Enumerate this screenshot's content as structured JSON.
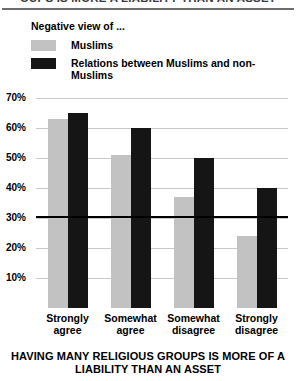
{
  "header": {
    "clipped_headline": "OUPS IS MORE A LIABILITY THAN AN ASSET"
  },
  "legend": {
    "title": "Negative view of ...",
    "items": [
      {
        "label": "Muslims",
        "color": "#c2c2c2"
      },
      {
        "label": "Relations between Muslims and non-Muslims",
        "color": "#151515"
      }
    ]
  },
  "chart_data": {
    "type": "bar",
    "title": "",
    "xlabel": "HAVING MANY RELIGIOUS GROUPS IS MORE OF A LIABILITY THAN AN ASSET",
    "ylabel": "",
    "categories": [
      "Strongly agree",
      "Somewhat agree",
      "Somewhat disagree",
      "Strongly disagree"
    ],
    "series": [
      {
        "name": "Muslims",
        "color": "#c2c2c2",
        "values": [
          63,
          51,
          37,
          24
        ]
      },
      {
        "name": "Relations between Muslims and non-Muslims",
        "color": "#151515",
        "values": [
          65,
          60,
          50,
          40
        ]
      }
    ],
    "ylim": [
      0,
      70
    ],
    "yticks": [
      70,
      60,
      50,
      40,
      30,
      20,
      10
    ],
    "ytick_labels": [
      "70%",
      "60%",
      "50%",
      "40%",
      "30%",
      "20%",
      "10%"
    ],
    "grid": true,
    "legend_position": "top-left"
  }
}
